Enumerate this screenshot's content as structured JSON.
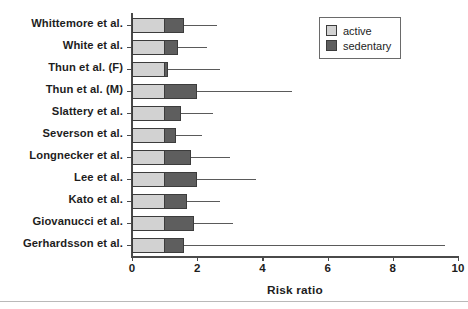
{
  "chart_data": {
    "type": "bar",
    "title": "",
    "subtitle": "",
    "xlabel": "Risk ratio",
    "ylabel": "",
    "orientation": "horizontal",
    "stacked": true,
    "grid": false,
    "xlim": [
      0,
      10
    ],
    "xticks": [
      0,
      2,
      4,
      6,
      8,
      10
    ],
    "xtick_labels": [
      "0",
      "2",
      "4",
      "6",
      "8",
      "10"
    ],
    "legend_position": "top-right",
    "legend": [
      {
        "name": "active",
        "color": "#d2d2d2"
      },
      {
        "name": "sedentary",
        "color": "#5e5e5e"
      }
    ],
    "categories": [
      "Whittemore et al.",
      "White et al.",
      "Thun et al. (F)",
      "Thun et al. (M)",
      "Slattery et al.",
      "Severson et al.",
      "Longnecker et al.",
      "Lee et al.",
      "Kato et al.",
      "Giovanucci et al.",
      "Gerhardsson et al."
    ],
    "series": [
      {
        "name": "active",
        "color": "#d2d2d2",
        "values": [
          1.0,
          1.0,
          1.0,
          1.0,
          1.0,
          1.0,
          1.0,
          1.0,
          1.0,
          1.0,
          1.0
        ]
      },
      {
        "name": "sedentary",
        "color": "#5e5e5e",
        "values": [
          1.6,
          1.4,
          1.1,
          2.0,
          1.5,
          1.35,
          1.8,
          2.0,
          1.7,
          1.9,
          1.6
        ]
      }
    ],
    "risk_ratio": [
      1.6,
      1.4,
      1.1,
      2.0,
      1.5,
      1.35,
      1.8,
      2.0,
      1.7,
      1.9,
      1.6
    ],
    "upper_confidence_limit": [
      2.6,
      2.3,
      2.7,
      4.9,
      2.5,
      2.15,
      3.0,
      3.8,
      2.7,
      3.1,
      9.6
    ],
    "rows": [
      {
        "label": "Whittemore et al.",
        "active": 1.0,
        "sedentary": 1.6,
        "upper": 2.6
      },
      {
        "label": "White et al.",
        "active": 1.0,
        "sedentary": 1.4,
        "upper": 2.3
      },
      {
        "label": "Thun et al. (F)",
        "active": 1.0,
        "sedentary": 1.1,
        "upper": 2.7
      },
      {
        "label": "Thun et al. (M)",
        "active": 1.0,
        "sedentary": 2.0,
        "upper": 4.9
      },
      {
        "label": "Slattery et al.",
        "active": 1.0,
        "sedentary": 1.5,
        "upper": 2.5
      },
      {
        "label": "Severson et al.",
        "active": 1.0,
        "sedentary": 1.35,
        "upper": 2.15
      },
      {
        "label": "Longnecker et al.",
        "active": 1.0,
        "sedentary": 1.8,
        "upper": 3.0
      },
      {
        "label": "Lee et al.",
        "active": 1.0,
        "sedentary": 2.0,
        "upper": 3.8
      },
      {
        "label": "Kato et al.",
        "active": 1.0,
        "sedentary": 1.7,
        "upper": 2.7
      },
      {
        "label": "Giovanucci et al.",
        "active": 1.0,
        "sedentary": 1.9,
        "upper": 3.1
      },
      {
        "label": "Gerhardsson et al.",
        "active": 1.0,
        "sedentary": 1.6,
        "upper": 9.6
      }
    ]
  },
  "axis": {
    "x_title": "Risk ratio"
  },
  "legend": {
    "items": [
      {
        "label": "active"
      },
      {
        "label": "sedentary"
      }
    ]
  }
}
